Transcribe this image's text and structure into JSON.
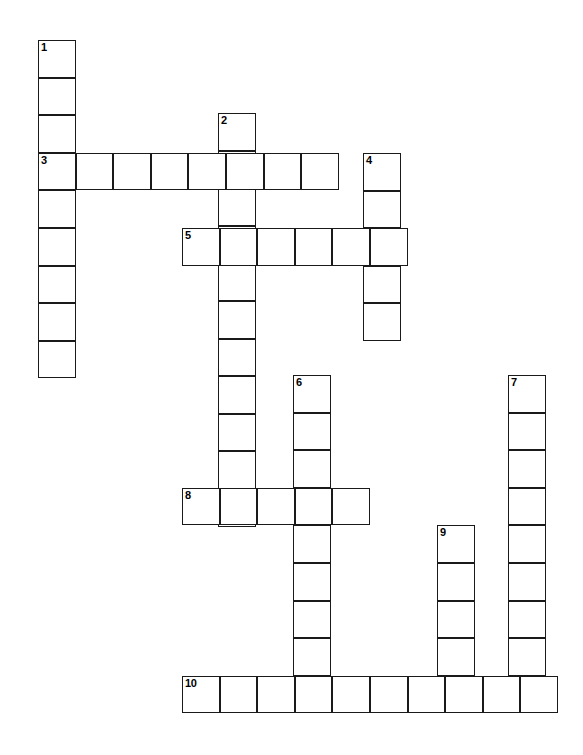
{
  "puzzle": {
    "kind": "crossword-grid",
    "title": "",
    "background_color": "#ffffff",
    "cell_border_color": "#1a1a1a",
    "number_color": "#000000",
    "cell_size": 37.6,
    "origin_x": 38,
    "origin_y": 40,
    "grid_width": 583,
    "grid_height": 755,
    "total_cells": 57,
    "numbered_cells": 10,
    "clue_numbers": [
      "1",
      "2",
      "3",
      "4",
      "5",
      "6",
      "7",
      "8",
      "9",
      "10"
    ],
    "entries": [
      {
        "number": "1",
        "direction": "down",
        "length": 9,
        "start_x": 38,
        "start_y": 40,
        "cells": [
          {
            "x": 38,
            "y": 40
          },
          {
            "x": 38,
            "y": 77.6
          },
          {
            "x": 38,
            "y": 115.2
          },
          {
            "x": 38,
            "y": 152.8
          },
          {
            "x": 38,
            "y": 190.4
          },
          {
            "x": 38,
            "y": 228
          },
          {
            "x": 38,
            "y": 265.6
          },
          {
            "x": 38,
            "y": 303.2
          },
          {
            "x": 38,
            "y": 340.8
          }
        ]
      },
      {
        "number": "2",
        "direction": "down",
        "length": 11,
        "start_x": 218,
        "start_y": 113,
        "cells": [
          {
            "x": 218,
            "y": 113
          },
          {
            "x": 218,
            "y": 150.6
          },
          {
            "x": 218,
            "y": 188.2
          },
          {
            "x": 218,
            "y": 225.8
          },
          {
            "x": 218,
            "y": 263.4
          },
          {
            "x": 218,
            "y": 301
          },
          {
            "x": 218,
            "y": 338.6
          },
          {
            "x": 218,
            "y": 376.2
          },
          {
            "x": 218,
            "y": 413.8
          },
          {
            "x": 218,
            "y": 451.4
          },
          {
            "x": 218,
            "y": 489
          }
        ]
      },
      {
        "number": "3",
        "direction": "across",
        "length": 8,
        "start_x": 38,
        "start_y": 152.8,
        "cells": [
          {
            "x": 38,
            "y": 152.8
          },
          {
            "x": 75.6,
            "y": 152.8
          },
          {
            "x": 113.2,
            "y": 152.8
          },
          {
            "x": 150.8,
            "y": 152.8
          },
          {
            "x": 188.4,
            "y": 152.8
          },
          {
            "x": 226,
            "y": 152.8
          },
          {
            "x": 263.6,
            "y": 152.8
          },
          {
            "x": 301.2,
            "y": 152.8
          }
        ]
      },
      {
        "number": "4",
        "direction": "down",
        "length": 5,
        "start_x": 363,
        "start_y": 153,
        "cells": [
          {
            "x": 363,
            "y": 153
          },
          {
            "x": 363,
            "y": 190.6
          },
          {
            "x": 363,
            "y": 228.2
          },
          {
            "x": 363,
            "y": 265.8
          },
          {
            "x": 363,
            "y": 303.4
          }
        ]
      },
      {
        "number": "5",
        "direction": "across",
        "length": 6,
        "start_x": 182,
        "start_y": 228.2,
        "cells": [
          {
            "x": 182,
            "y": 228.2
          },
          {
            "x": 219.6,
            "y": 228.2
          },
          {
            "x": 257.2,
            "y": 228.2
          },
          {
            "x": 294.8,
            "y": 228.2
          },
          {
            "x": 332.4,
            "y": 228.2
          },
          {
            "x": 370,
            "y": 228.2
          }
        ]
      },
      {
        "number": "6",
        "direction": "down",
        "length": 9,
        "start_x": 293,
        "start_y": 375,
        "cells": [
          {
            "x": 293,
            "y": 375
          },
          {
            "x": 293,
            "y": 412.6
          },
          {
            "x": 293,
            "y": 450.2
          },
          {
            "x": 293,
            "y": 487.8
          },
          {
            "x": 293,
            "y": 525.4
          },
          {
            "x": 293,
            "y": 563
          },
          {
            "x": 293,
            "y": 600.6
          },
          {
            "x": 293,
            "y": 638.2
          },
          {
            "x": 293,
            "y": 675.8
          }
        ]
      },
      {
        "number": "7",
        "direction": "down",
        "length": 9,
        "start_x": 508,
        "start_y": 375,
        "cells": [
          {
            "x": 508,
            "y": 375
          },
          {
            "x": 508,
            "y": 412.6
          },
          {
            "x": 508,
            "y": 450.2
          },
          {
            "x": 508,
            "y": 487.8
          },
          {
            "x": 508,
            "y": 525.4
          },
          {
            "x": 508,
            "y": 563
          },
          {
            "x": 508,
            "y": 600.6
          },
          {
            "x": 508,
            "y": 638.2
          },
          {
            "x": 508,
            "y": 675.8
          }
        ]
      },
      {
        "number": "8",
        "direction": "across",
        "length": 5,
        "start_x": 182,
        "start_y": 487.8,
        "cells": [
          {
            "x": 182,
            "y": 487.8
          },
          {
            "x": 219.6,
            "y": 487.8
          },
          {
            "x": 257.2,
            "y": 487.8
          },
          {
            "x": 294.8,
            "y": 487.8
          },
          {
            "x": 332.4,
            "y": 487.8
          }
        ]
      },
      {
        "number": "9",
        "direction": "down",
        "length": 5,
        "start_x": 437,
        "start_y": 525.4,
        "cells": [
          {
            "x": 437,
            "y": 525.4
          },
          {
            "x": 437,
            "y": 563
          },
          {
            "x": 437,
            "y": 600.6
          },
          {
            "x": 437,
            "y": 638.2
          },
          {
            "x": 437,
            "y": 675.8
          }
        ]
      },
      {
        "number": "10",
        "direction": "across",
        "length": 10,
        "start_x": 182,
        "start_y": 675.8,
        "cells": [
          {
            "x": 182,
            "y": 675.8
          },
          {
            "x": 219.6,
            "y": 675.8
          },
          {
            "x": 257.2,
            "y": 675.8
          },
          {
            "x": 294.8,
            "y": 675.8
          },
          {
            "x": 332.4,
            "y": 675.8
          },
          {
            "x": 370,
            "y": 675.8
          },
          {
            "x": 407.6,
            "y": 675.8
          },
          {
            "x": 445.2,
            "y": 675.8
          },
          {
            "x": 482.8,
            "y": 675.8
          },
          {
            "x": 520.4,
            "y": 675.8
          }
        ]
      }
    ]
  }
}
